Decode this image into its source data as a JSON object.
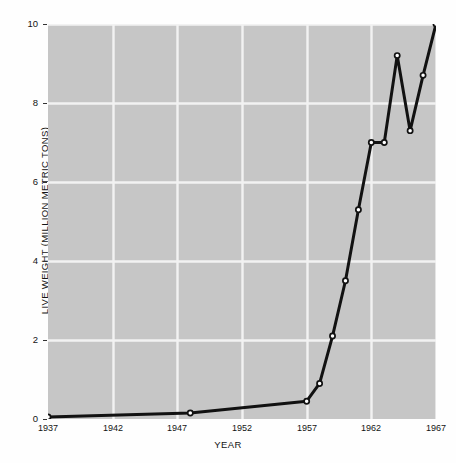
{
  "figure": {
    "background_color": "#fefefe",
    "plot_background_color": "#c6c6c6",
    "grid_color": "#f2f2f2",
    "line_color": "#111111",
    "marker_fill": "#ffffff"
  },
  "chart_data": {
    "type": "line",
    "title": "",
    "xlabel": "YEAR",
    "ylabel": "LIVE WEIGHT (MILLION METRIC TONS)",
    "xlim": [
      1937,
      1967
    ],
    "ylim": [
      0,
      10
    ],
    "xticks": [
      1937,
      1942,
      1947,
      1952,
      1957,
      1962,
      1967
    ],
    "xtick_labels": [
      "1937",
      "1942",
      "1947",
      "1952",
      "1957",
      "1962",
      "1967"
    ],
    "yticks": [
      0,
      2,
      4,
      6,
      8,
      10
    ],
    "ytick_labels": [
      "0",
      "2",
      "4",
      "6",
      "8",
      "10"
    ],
    "grid": true,
    "legend": "none",
    "markers": "open-circle",
    "series": [
      {
        "name": "Live weight",
        "x": [
          1937,
          1948,
          1957,
          1958,
          1959,
          1960,
          1961,
          1962,
          1963,
          1964,
          1965,
          1966,
          1967
        ],
        "values": [
          0.05,
          0.15,
          0.45,
          0.9,
          2.1,
          3.5,
          5.3,
          7.0,
          7.0,
          9.2,
          7.3,
          8.7,
          10.0
        ]
      }
    ]
  },
  "caption": {
    "partial_text": ""
  }
}
